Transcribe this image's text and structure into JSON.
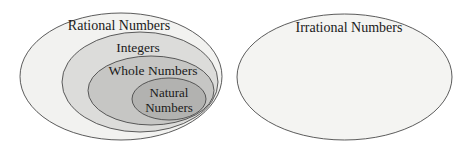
{
  "diagram": {
    "type": "venn-nested-sets",
    "background_color": "#ffffff",
    "stroke_color": "#4a4a4a",
    "text_color": "#1a1a1a",
    "groups": [
      {
        "name": "rational-group",
        "description": "Nested ellipses showing subsets of the rational numbers"
      },
      {
        "name": "irrational-group",
        "description": "Separate disjoint ellipse for irrational numbers"
      }
    ],
    "sets": [
      {
        "key": "rational",
        "label": "Rational Numbers",
        "fill": "#f2f2f0",
        "cx": 121,
        "cy": 76.5,
        "rx": 101,
        "ry": 63.5,
        "label_x": 119,
        "label_y": 30
      },
      {
        "key": "integers",
        "label": "Integers",
        "fill": "#dcdcda",
        "cx": 140,
        "cy": 82,
        "rx": 78,
        "ry": 50,
        "label_x": 138,
        "label_y": 52
      },
      {
        "key": "whole",
        "label": "Whole Numbers",
        "fill": "#c6c6c4",
        "cx": 151,
        "cy": 90.5,
        "rx": 63,
        "ry": 34.5,
        "label_x": 153,
        "label_y": 75
      },
      {
        "key": "natural",
        "label": "Natural Numbers",
        "label_line1": "Natural",
        "label_line2": "Numbers",
        "fill": "#b2b2b0",
        "cx": 169,
        "cy": 99,
        "rx": 37,
        "ry": 21,
        "label_x": 169,
        "label_y1": 97,
        "label_y2": 112
      },
      {
        "key": "irrational",
        "label": "Irrational Numbers",
        "fill": "#f4f4f2",
        "cx": 344.5,
        "cy": 77,
        "rx": 107.5,
        "ry": 63,
        "label_x": 349,
        "label_y": 32
      }
    ]
  }
}
